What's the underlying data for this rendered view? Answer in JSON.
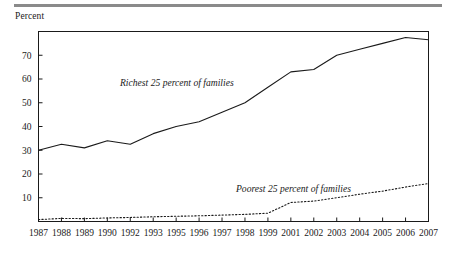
{
  "figure": {
    "ylabel": "Percent",
    "y_ticks": [
      10,
      20,
      30,
      40,
      50,
      60,
      70
    ],
    "x_tick_labels": [
      "1987",
      "1988",
      "1989",
      "1990",
      "1992",
      "1993",
      "1995",
      "1996",
      "1997",
      "1998",
      "1999",
      "2001",
      "2002",
      "2003",
      "2004",
      "2005",
      "2006",
      "2007"
    ],
    "series_label_richest": "Richest 25 percent of families",
    "series_label_poorest": "Poorest 25 percent of families",
    "line_color": "#1a1a1a",
    "rule_color": "#8a8a8a"
  },
  "chart_data": {
    "type": "line",
    "title": "",
    "xlabel": "",
    "ylabel": "Percent",
    "ylim": [
      0,
      80
    ],
    "grid": false,
    "legend": "inline-annotations",
    "categories": [
      "1987",
      "1988",
      "1989",
      "1990",
      "1992",
      "1993",
      "1995",
      "1996",
      "1997",
      "1998",
      "1999",
      "2001",
      "2002",
      "2003",
      "2004",
      "2005",
      "2006",
      "2007"
    ],
    "series": [
      {
        "name": "Richest 25 percent of families",
        "style": "solid",
        "values": [
          30.0,
          32.5,
          31.0,
          34.0,
          32.5,
          37.0,
          40.0,
          42.0,
          46.0,
          50.0,
          56.5,
          63.0,
          64.0,
          70.0,
          72.5,
          75.0,
          77.5,
          76.5
        ]
      },
      {
        "name": "Poorest 25 percent of families",
        "style": "dotted",
        "values": [
          0.8,
          1.3,
          1.2,
          1.5,
          1.7,
          2.0,
          2.2,
          2.4,
          2.7,
          3.0,
          3.5,
          8.0,
          8.6,
          10.0,
          11.5,
          12.8,
          14.5,
          16.0
        ]
      }
    ]
  }
}
